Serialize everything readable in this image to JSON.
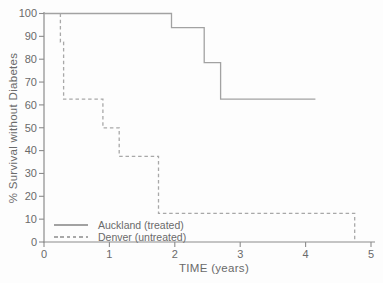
{
  "chart_data": {
    "type": "line",
    "subtype": "kaplan-meier-step-survival",
    "title": "",
    "xlabel": "TIME (years)",
    "ylabel": "% Survival without Diabetes",
    "xlim": [
      0,
      5
    ],
    "ylim": [
      0,
      100
    ],
    "xticks": [
      "0",
      "1",
      "2",
      "3",
      "4",
      "5"
    ],
    "yticks": [
      "0",
      "10",
      "20",
      "30",
      "40",
      "50",
      "60",
      "70",
      "80",
      "90",
      "100"
    ],
    "grid": false,
    "legend": {
      "position": "inside-lower-left",
      "entries": [
        {
          "label": "Auckland (treated)",
          "line_style": "solid"
        },
        {
          "label": "Denver (untreated)",
          "line_style": "dashed"
        }
      ]
    },
    "series": [
      {
        "name": "Auckland (treated)",
        "line_style": "solid",
        "color": "#a2a2a2",
        "points": [
          [
            0,
            100
          ],
          [
            1.95,
            100
          ],
          [
            1.95,
            93.8
          ],
          [
            2.45,
            93.8
          ],
          [
            2.45,
            78.5
          ],
          [
            2.7,
            78.5
          ],
          [
            2.7,
            62.5
          ],
          [
            4.15,
            62.5
          ]
        ]
      },
      {
        "name": "Denver (untreated)",
        "line_style": "dashed",
        "color": "#a8a8a8",
        "points": [
          [
            0.25,
            100
          ],
          [
            0.25,
            87.5
          ],
          [
            0.3,
            87.5
          ],
          [
            0.3,
            62.5
          ],
          [
            0.9,
            62.5
          ],
          [
            0.9,
            50
          ],
          [
            1.15,
            50
          ],
          [
            1.15,
            37.5
          ],
          [
            1.75,
            37.5
          ],
          [
            1.75,
            12.5
          ],
          [
            4.75,
            12.5
          ],
          [
            4.75,
            0
          ]
        ]
      }
    ],
    "colors": {
      "axis": "#8c8c8c",
      "tick_text": "#6a6a6a",
      "line_gray": "#a4a4a4",
      "background": "#fdfdfd"
    }
  }
}
